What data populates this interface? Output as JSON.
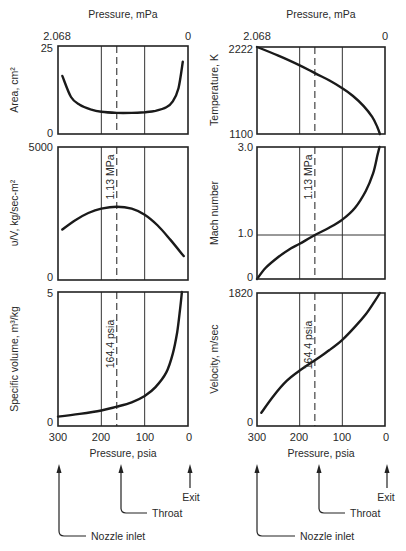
{
  "chart_data": [
    {
      "type": "line",
      "panel": "top-left",
      "title": "",
      "xlabel_top": "Pressure, mPa",
      "x_top_ticks": [
        "2.068",
        "0"
      ],
      "xlabel": "Pressure, psia",
      "ylabel": "Area, cm2",
      "ylim": [
        0,
        25
      ],
      "y_ticks": [
        "0",
        "25"
      ],
      "xlim": [
        300,
        0
      ],
      "grid_x": [
        200,
        100
      ],
      "dashed_x": 164.4,
      "x": [
        290,
        270,
        250,
        225,
        200,
        164.4,
        130,
        100,
        75,
        50,
        35,
        22,
        12
      ],
      "values": [
        16.5,
        10.5,
        8.3,
        7.0,
        6.3,
        6.0,
        6.0,
        6.2,
        6.6,
        7.6,
        9.3,
        13.0,
        20.5
      ]
    },
    {
      "type": "line",
      "panel": "top-right",
      "xlabel_top": "Pressure, mPa",
      "x_top_ticks": [
        "2.068",
        "0"
      ],
      "xlabel": "Pressure, psia",
      "ylabel": "Temperature, K",
      "ylim": [
        1100,
        2222
      ],
      "y_ticks": [
        "1100",
        "2222"
      ],
      "xlim": [
        300,
        0
      ],
      "grid_x": [
        200,
        100
      ],
      "dashed_x": 164.4,
      "x": [
        300,
        250,
        200,
        164.4,
        130,
        100,
        75,
        50,
        30,
        18,
        12
      ],
      "values": [
        2222,
        2110,
        1985,
        1885,
        1790,
        1690,
        1590,
        1460,
        1320,
        1190,
        1100
      ]
    },
    {
      "type": "line",
      "panel": "middle-left",
      "xlabel": "Pressure, psia",
      "ylabel": "υ/V, kg/sec-m²",
      "ylim": [
        0,
        5000
      ],
      "y_ticks": [
        "0",
        "5000"
      ],
      "xlim": [
        300,
        0
      ],
      "grid_x": [
        200,
        100
      ],
      "dashed_x": 164.4,
      "annotation": "1.13 MPa",
      "x": [
        290,
        260,
        230,
        200,
        164.4,
        130,
        100,
        70,
        40,
        10
      ],
      "values": [
        1900,
        2250,
        2520,
        2680,
        2750,
        2680,
        2450,
        2050,
        1500,
        900
      ]
    },
    {
      "type": "line",
      "panel": "middle-right",
      "xlabel": "Pressure, psia",
      "ylabel": "Mach number",
      "ylim": [
        0,
        3.0
      ],
      "y_ticks": [
        "0",
        "1.0",
        "3.0"
      ],
      "xlim": [
        300,
        0
      ],
      "grid_x": [
        200,
        100
      ],
      "grid_y": [
        1.0
      ],
      "dashed_x": 164.4,
      "annotation": "1.13 MPa",
      "x": [
        300,
        280,
        250,
        220,
        200,
        164.4,
        130,
        100,
        70,
        45,
        28,
        18,
        13
      ],
      "values": [
        0,
        0.25,
        0.5,
        0.7,
        0.8,
        1.0,
        1.17,
        1.35,
        1.62,
        2.0,
        2.4,
        2.8,
        3.0
      ]
    },
    {
      "type": "line",
      "panel": "bottom-left",
      "xlabel": "Pressure, psia",
      "ylabel": "Specific volume, m³/kg",
      "ylim": [
        0,
        5
      ],
      "y_ticks": [
        "0",
        "5"
      ],
      "x_ticks": [
        "300",
        "200",
        "100",
        "0"
      ],
      "xlim": [
        300,
        0
      ],
      "grid_x": [
        200,
        100
      ],
      "dashed_x": 164.4,
      "annotation": "164.4 psia",
      "x": [
        300,
        250,
        200,
        164.4,
        130,
        100,
        75,
        50,
        35,
        25,
        18,
        14
      ],
      "values": [
        0.35,
        0.45,
        0.58,
        0.72,
        0.88,
        1.12,
        1.45,
        2.0,
        2.7,
        3.5,
        4.4,
        5.0
      ]
    },
    {
      "type": "line",
      "panel": "bottom-right",
      "xlabel": "Pressure, psia",
      "ylabel": "Velocity, m/sec",
      "ylim": [
        0,
        1820
      ],
      "y_ticks": [
        "0",
        "1820"
      ],
      "x_ticks": [
        "300",
        "200",
        "100",
        "0"
      ],
      "xlim": [
        300,
        0
      ],
      "grid_x": [
        200,
        100
      ],
      "dashed_x": 164.4,
      "annotation": "164.4 psia",
      "x": [
        290,
        260,
        230,
        200,
        164.4,
        130,
        100,
        70,
        45,
        25,
        12
      ],
      "values": [
        180,
        420,
        620,
        760,
        900,
        1040,
        1180,
        1360,
        1530,
        1700,
        1820
      ]
    }
  ],
  "labels": {
    "top_axis_title": "Pressure, mPa",
    "top_tick_left": "2.068",
    "top_tick_right": "0",
    "bottom_axis_title": "Pressure, psia",
    "bottom_ticks": [
      "300",
      "200",
      "100",
      "0"
    ],
    "y_area": "Area, cm²",
    "y_temp": "Temperature, K",
    "y_flux": "υ/V, kg/sec-m²",
    "y_mach": "Mach number",
    "y_specvol": "Specific volume, m³/kg",
    "y_velocity": "Velocity, m/sec",
    "mpa_annotation": "1.13 MPa",
    "psia_annotation": "164.4 psia",
    "ticks": {
      "area_top": "25",
      "area_bottom": "0",
      "temp_top": "2222",
      "temp_bottom": "1100",
      "flux_top": "5000",
      "flux_bottom": "0",
      "mach_top": "3.0",
      "mach_mid": "1.0",
      "mach_bottom": "0",
      "specvol_top": "5",
      "specvol_bottom": "0",
      "vel_top": "1820",
      "vel_bottom": "0"
    },
    "locations": {
      "inlet": "Nozzle inlet",
      "throat": "Throat",
      "exit": "Exit"
    }
  }
}
